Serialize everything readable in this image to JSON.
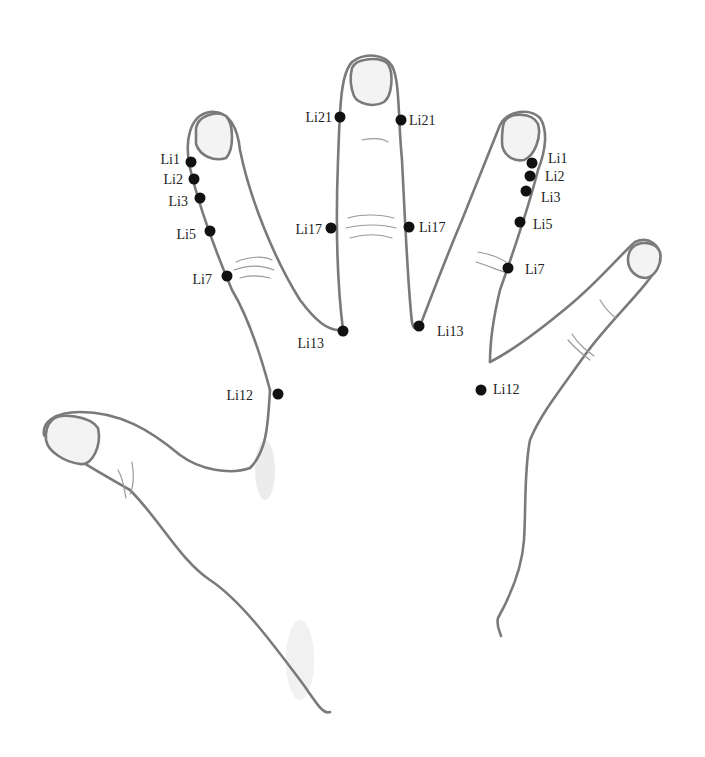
{
  "diagram": {
    "colors": {
      "outline": "#7a7a7a",
      "point": "#111111",
      "label": "#222222",
      "background": "#ffffff"
    },
    "points": [
      {
        "id": "li1-left",
        "label": "Li1",
        "x": 191,
        "y": 162,
        "label_x": 180,
        "label_side": "left"
      },
      {
        "id": "li2-left",
        "label": "Li2",
        "x": 194,
        "y": 179,
        "label_x": 183,
        "label_side": "left"
      },
      {
        "id": "li3-left",
        "label": "Li3",
        "x": 200,
        "y": 198,
        "label_x": 188,
        "label_side": "left"
      },
      {
        "id": "li5-left",
        "label": "Li5",
        "x": 210,
        "y": 231,
        "label_x": 196,
        "label_side": "left"
      },
      {
        "id": "li7-left",
        "label": "Li7",
        "x": 227,
        "y": 276,
        "label_x": 212,
        "label_side": "left"
      },
      {
        "id": "li21-left",
        "label": "Li21",
        "x": 340,
        "y": 117,
        "label_x": 330,
        "label_side": "left"
      },
      {
        "id": "li21-right",
        "label": "Li21",
        "x": 401,
        "y": 120,
        "label_x": 410,
        "label_side": "right"
      },
      {
        "id": "li17-left",
        "label": "Li17",
        "x": 331,
        "y": 228,
        "label_x": 321,
        "label_side": "left"
      },
      {
        "id": "li17-right",
        "label": "Li17",
        "x": 409,
        "y": 227,
        "label_x": 419,
        "label_side": "right"
      },
      {
        "id": "li13-left",
        "label": "Li13",
        "x": 343,
        "y": 331,
        "label_x": 323,
        "label_y": 345,
        "label_side": "left"
      },
      {
        "id": "li13-right",
        "label": "Li13",
        "x": 419,
        "y": 326,
        "label_x": 436,
        "label_y": 333,
        "label_side": "right"
      },
      {
        "id": "li12-left",
        "label": "Li12",
        "x": 278,
        "y": 394,
        "label_x": 252,
        "label_side": "left"
      },
      {
        "id": "li12-right",
        "label": "Li12",
        "x": 481,
        "y": 390,
        "label_x": 493,
        "label_side": "right"
      },
      {
        "id": "li1-right",
        "label": "Li1",
        "x": 532,
        "y": 163,
        "label_x": 548,
        "label_side": "right"
      },
      {
        "id": "li2-right",
        "label": "Li2",
        "x": 530,
        "y": 176,
        "label_x": 545,
        "label_side": "right"
      },
      {
        "id": "li3-right",
        "label": "Li3",
        "x": 526,
        "y": 191,
        "label_x": 541,
        "label_side": "right"
      },
      {
        "id": "li5-right",
        "label": "Li5",
        "x": 520,
        "y": 222,
        "label_x": 533,
        "label_side": "right"
      },
      {
        "id": "li7-right",
        "label": "Li7",
        "x": 508,
        "y": 268,
        "label_x": 525,
        "label_side": "right"
      }
    ]
  }
}
